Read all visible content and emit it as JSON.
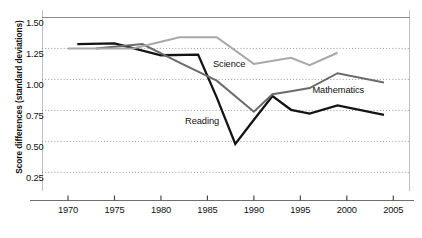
{
  "chart_data": {
    "type": "line",
    "title": "",
    "xlabel": "",
    "ylabel": "Score differences (standard deviations)",
    "xlim": [
      1967.2,
      2006.8
    ],
    "ylim": [
      0.1,
      1.56
    ],
    "grid": true,
    "legend_position": "inline-annotations",
    "ytick_labels": [
      "1.50",
      "1.25",
      "1.00",
      "0.75",
      "0.50",
      "0.25"
    ],
    "ytick_values": [
      1.5,
      1.25,
      1.0,
      0.75,
      0.5,
      0.25
    ],
    "xtick_labels": [
      "1970",
      "1975",
      "1980",
      "1985",
      "1990",
      "1995",
      "2000",
      "2005"
    ],
    "xtick_values": [
      1970,
      1975,
      1980,
      1985,
      1990,
      1995,
      2000,
      2005
    ],
    "series": [
      {
        "name": "Reading",
        "color": "#141414",
        "label_x": 1982.6,
        "label_y": 0.655,
        "x": [
          1971,
          1975,
          1980,
          1984,
          1986,
          1988,
          1990,
          1992,
          1994,
          1996,
          1999,
          2004
        ],
        "y": [
          1.285,
          1.29,
          1.195,
          1.2,
          0.855,
          0.48,
          0.675,
          0.865,
          0.755,
          0.725,
          0.79,
          0.715
        ],
        "values": [
          1.285,
          1.29,
          1.195,
          1.2,
          0.855,
          0.48,
          0.675,
          0.865,
          0.755,
          0.725,
          0.79,
          0.715
        ]
      },
      {
        "name": "Mathematics",
        "color": "#6b6b6b",
        "label_x": 1996.3,
        "label_y": 0.905,
        "x": [
          1973,
          1978,
          1982,
          1986,
          1990,
          1992,
          1994,
          1996,
          1999,
          2004
        ],
        "y": [
          1.25,
          1.285,
          1.135,
          0.99,
          0.74,
          0.88,
          0.905,
          0.93,
          1.05,
          0.975
        ],
        "values": [
          1.25,
          1.285,
          1.135,
          0.99,
          0.74,
          0.88,
          0.905,
          0.93,
          1.05,
          0.975
        ]
      },
      {
        "name": "Science",
        "color": "#a8a8a8",
        "label_x": 1985.6,
        "label_y": 1.115,
        "x": [
          1970,
          1977,
          1982,
          1986,
          1990,
          1994,
          1996,
          1999
        ],
        "y": [
          1.25,
          1.25,
          1.34,
          1.34,
          1.125,
          1.175,
          1.115,
          1.215
        ],
        "values": [
          1.25,
          1.25,
          1.34,
          1.34,
          1.125,
          1.175,
          1.115,
          1.215
        ]
      }
    ]
  },
  "axes": {
    "ylabel": "Score differences (standard deviations)"
  }
}
